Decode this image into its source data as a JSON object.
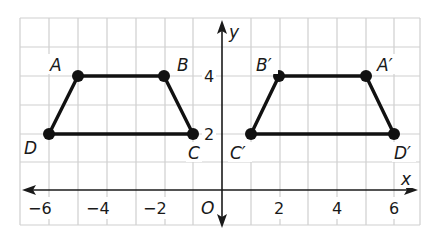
{
  "diagram": {
    "type": "coordinate-grid-reflection",
    "axes": {
      "x_label": "x",
      "y_label": "y",
      "origin_label": "O"
    },
    "x_ticks": [
      "−6",
      "−4",
      "−2",
      "2",
      "4",
      "6"
    ],
    "y_ticks": [
      "2",
      "4"
    ],
    "figures": [
      {
        "name": "ABCD",
        "points": [
          {
            "label": "A",
            "x": -5,
            "y": 4
          },
          {
            "label": "B",
            "x": -2,
            "y": 4
          },
          {
            "label": "C",
            "x": -1,
            "y": 2
          },
          {
            "label": "D",
            "x": -6,
            "y": 2
          }
        ]
      },
      {
        "name": "A'B'C'D'",
        "points": [
          {
            "label": "A′",
            "x": 5,
            "y": 4
          },
          {
            "label": "B′",
            "x": 2,
            "y": 4
          },
          {
            "label": "C′",
            "x": 1,
            "y": 2
          },
          {
            "label": "D′",
            "x": 6,
            "y": 2
          }
        ]
      }
    ]
  }
}
